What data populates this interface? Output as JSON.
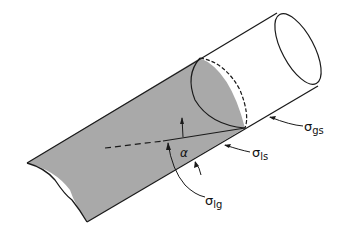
{
  "figure": {
    "colors": {
      "liquid_fill": "#a9a9a9",
      "line": "#1a1a1a",
      "background": "#ffffff"
    },
    "labels": {
      "angle": "α",
      "gas_solid_sigma": "σ",
      "gas_solid_sub": "gs",
      "liquid_solid_sigma": "σ",
      "liquid_solid_sub": "ls",
      "liquid_gas_sigma": "σ",
      "liquid_gas_sub": "lg"
    }
  }
}
